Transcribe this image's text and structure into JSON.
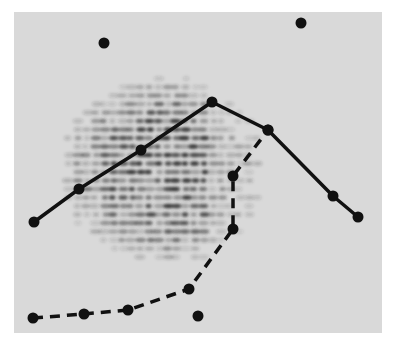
{
  "figure": {
    "panel": {
      "x": 14,
      "y": 12,
      "width": 368,
      "height": 321,
      "color": "#d9d9d9"
    },
    "spot_color": "#2a2a2a",
    "pattern": {
      "cx": 165,
      "cy": 170,
      "rx": 115,
      "ry": 100,
      "row_spacing": 8.5,
      "spot_spacing": 9
    },
    "solid_line": {
      "color": "#111111",
      "points": [
        [
          34,
          222
        ],
        [
          79,
          189
        ],
        [
          141,
          150
        ],
        [
          212,
          102
        ],
        [
          268,
          130
        ],
        [
          333,
          196
        ],
        [
          358,
          217
        ]
      ]
    },
    "dashed_line": {
      "color": "#111111",
      "points": [
        [
          33,
          318
        ],
        [
          84,
          314
        ],
        [
          128,
          310
        ],
        [
          189,
          289
        ],
        [
          233,
          229
        ],
        [
          233,
          176
        ],
        [
          268,
          130
        ]
      ]
    },
    "isolated_dots": [
      [
        104,
        43
      ],
      [
        301,
        23
      ],
      [
        198,
        316
      ]
    ]
  }
}
